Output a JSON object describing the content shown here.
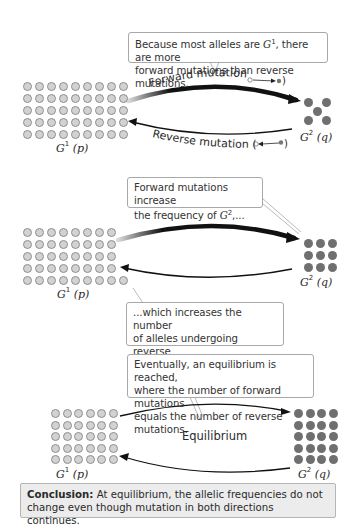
{
  "panels": [
    {
      "callout_top": {
        "line1_pre": "Because most alleles are ",
        "line1_allele": "G",
        "line1_sup": "1",
        "line1_post": ", there are more",
        "line2": "forward mutations than reverse mutations."
      },
      "forward_label": "Forward mutation (",
      "reverse_label": "Reverse mutation (",
      "close_paren": ")",
      "g1_label": {
        "symbol": "G",
        "sup": "1",
        "freq": "(p)"
      },
      "g2_label": {
        "symbol": "G",
        "sup": "2",
        "freq": "(q)"
      },
      "g1_count": 45,
      "g1_grid": "9x5",
      "g2_count": 5,
      "g2_layout": "quincunx"
    },
    {
      "callout_top": {
        "line1": "Forward mutations increase",
        "line2_pre": "the frequency of ",
        "line2_allele": "G",
        "line2_sup": "2",
        "line2_post": ",..."
      },
      "callout_bottom": {
        "line1": "...which increases the number",
        "line2": "of alleles undergoing reverse",
        "line3": "mutation."
      },
      "g1_label": {
        "symbol": "G",
        "sup": "1",
        "freq": "(p)"
      },
      "g2_label": {
        "symbol": "G",
        "sup": "2",
        "freq": "(q)"
      },
      "g1_count": 41,
      "g1_grid": "8x5 + 1",
      "g2_count": 9,
      "g2_grid": "3x3"
    },
    {
      "callout_top": {
        "line1": "Eventually, an equilibrium is reached,",
        "line2": "where the number of forward mutations",
        "line3": "equals the number of reverse mutations."
      },
      "center_label": "Equilibrium",
      "g1_label": {
        "symbol": "G",
        "sup": "1",
        "freq": "(p)"
      },
      "g2_label": {
        "symbol": "G",
        "sup": "2",
        "freq": "(q)"
      },
      "g1_count": 30,
      "g1_grid": "6x5",
      "g2_count": 20,
      "g2_grid": "4x5"
    }
  ],
  "conclusion": {
    "lead": "Conclusion:",
    "line1": " At equilibrium, the allelic frequencies do not",
    "line2": "change even though mutation in both directions continues."
  },
  "colors": {
    "g1_fill": "#d2d2d2",
    "g1_stroke": "#8f8f8f",
    "g2_fill": "#6f6f6f",
    "arrow": "#111111",
    "callout_border": "#a8a8a8",
    "conclusion_bg": "#ececec"
  }
}
